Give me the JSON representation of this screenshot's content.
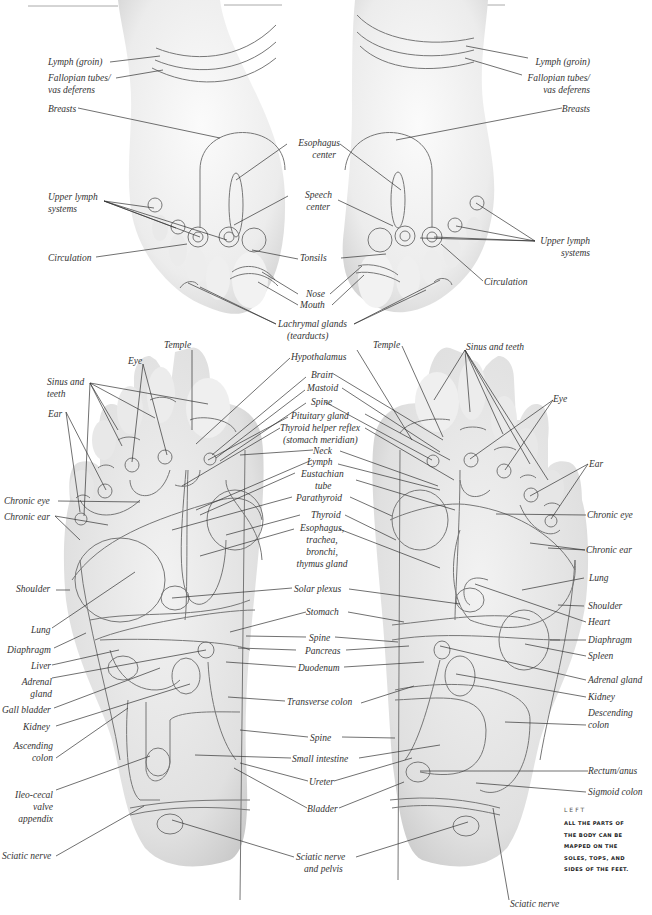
{
  "caption": {
    "side": "LEFT",
    "lines": [
      "ALL THE PARTS OF",
      "THE BODY CAN BE",
      "MAPPED ON THE",
      "SOLES, TOPS, AND",
      "SIDES OF THE FEET."
    ]
  },
  "tops": {
    "left_labels": {
      "lymph_groin": "Lymph (groin)",
      "fallopian_1": "Fallopian tubes/",
      "fallopian_2": "vas deferens",
      "breasts": "Breasts",
      "upper_lymph_1": "Upper lymph",
      "upper_lymph_2": "systems",
      "circulation": "Circulation"
    },
    "center_labels": {
      "esophagus_1": "Esophagus",
      "esophagus_2": "center",
      "speech_1": "Speech",
      "speech_2": "center",
      "tonsils": "Tonsils",
      "nose": "Nose",
      "mouth": "Mouth",
      "lachrymal_1": "Lachrymal glands",
      "lachrymal_2": "(tearducts)"
    },
    "right_labels": {
      "lymph_groin": "Lymph (groin)",
      "fallopian_1": "Fallopian tubes/",
      "fallopian_2": "vas deferens",
      "breasts": "Breasts",
      "upper_lymph_1": "Upper lymph",
      "upper_lymph_2": "systems",
      "circulation": "Circulation"
    }
  },
  "soles": {
    "left_labels": {
      "temple": "Temple",
      "eye": "Eye",
      "sinus_1": "Sinus and",
      "sinus_2": "teeth",
      "ear": "Ear",
      "chronic_eye": "Chronic eye",
      "chronic_ear": "Chronic ear",
      "shoulder": "Shoulder",
      "lung": "Lung",
      "diaphragm": "Diaphragm",
      "liver": "Liver",
      "adrenal_1": "Adrenal",
      "adrenal_2": "gland",
      "gall_bladder": "Gall bladder",
      "kidney": "Kidney",
      "ascending_1": "Ascending",
      "ascending_2": "colon",
      "ileo_1": "Ileo-cecal",
      "ileo_2": "valve",
      "ileo_3": "appendix",
      "sciatic": "Sciatic nerve"
    },
    "center_labels": {
      "hypothalamus": "Hypothalamus",
      "brain": "Brain",
      "mastoid": "Mastoid",
      "spine_top": "Spine",
      "pituitary": "Pituitary gland",
      "thyroid_helper_1": "Thyroid helper reflex",
      "thyroid_helper_2": "(stomach meridian)",
      "neck": "Neck",
      "lymph": "Lymph",
      "eustachian_1": "Eustachian",
      "eustachian_2": "tube",
      "parathyroid": "Parathyroid",
      "thyroid": "Thyroid",
      "esophagus_1": "Esophagus,",
      "esophagus_2": "trachea,",
      "esophagus_3": "bronchi,",
      "esophagus_4": "thymus gland",
      "solar_plexus": "Solar plexus",
      "stomach": "Stomach",
      "spine_mid": "Spine",
      "pancreas": "Pancreas",
      "duodenum": "Duodenum",
      "transverse_colon": "Transverse colon",
      "spine_low": "Spine",
      "small_intestine": "Small intestine",
      "ureter": "Ureter",
      "bladder": "Bladder",
      "sciatic_pelvis_1": "Sciatic nerve",
      "sciatic_pelvis_2": "and pelvis"
    },
    "right_labels": {
      "temple": "Temple",
      "sinus": "Sinus and teeth",
      "eye": "Eye",
      "ear": "Ear",
      "chronic_eye": "Chronic eye",
      "chronic_ear": "Chronic ear",
      "lung": "Lung",
      "shoulder": "Shoulder",
      "heart": "Heart",
      "diaphragm": "Diaphragm",
      "spleen": "Spleen",
      "adrenal": "Adrenal gland",
      "kidney": "Kidney",
      "descending_1": "Descending",
      "descending_2": "colon",
      "rectum": "Rectum/anus",
      "sigmoid": "Sigmoid colon",
      "sciatic": "Sciatic nerve"
    }
  },
  "colors": {
    "skin_light": "#f4f4f4",
    "skin_mid": "#dcdcdc",
    "zone_line": "#777777",
    "leader_line": "#333333",
    "text": "#333333"
  }
}
